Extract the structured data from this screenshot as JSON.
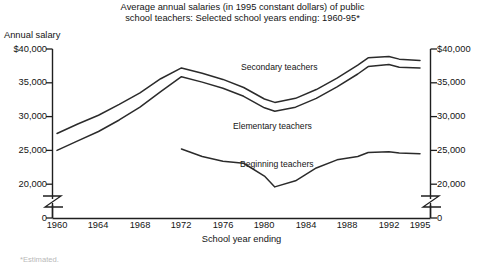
{
  "title": {
    "line1": "Average annual salaries (in 1995 constant dollars) of public",
    "line2": "school teachers: Selected school years ending: 1960-95*"
  },
  "axes": {
    "y_caption": "Annual salary",
    "x_title": "School year ending",
    "y_ticks": [
      "$40,000",
      "35,000",
      "30,000",
      "25,000",
      "20,000",
      "0"
    ],
    "x_ticks": [
      "1960",
      "1964",
      "1968",
      "1972",
      "1976",
      "1980",
      "1984",
      "1988",
      "1992",
      "1995"
    ],
    "axis_break": "zigzag-break"
  },
  "series_labels": {
    "secondary": "Secondary teachers",
    "elementary": "Elementary teachers",
    "beginning": "Beginning teachers"
  },
  "footnote": "*Estimated.",
  "colors": {
    "background": "#ffffff",
    "line": "#2b2b2b",
    "axis": "#1f1f1f",
    "text": "#141414"
  },
  "chart_data": {
    "type": "line",
    "title": "Average annual salaries (in 1995 constant dollars) of public school teachers: Selected school years ending: 1960-95*",
    "xlabel": "School year ending",
    "ylabel": "Annual salary",
    "ylim": [
      20000,
      40000
    ],
    "y_axis_broken_to_zero": true,
    "xlim": [
      1960,
      1995
    ],
    "grid": false,
    "legend": "inline-labels",
    "x_tick_values": [
      1960,
      1964,
      1968,
      1972,
      1976,
      1980,
      1984,
      1988,
      1992,
      1995
    ],
    "y_tick_values": [
      20000,
      25000,
      30000,
      35000,
      40000
    ],
    "series": [
      {
        "name": "Secondary teachers",
        "x": [
          1960,
          1962,
          1964,
          1966,
          1968,
          1970,
          1972,
          1974,
          1976,
          1978,
          1980,
          1981,
          1983,
          1985,
          1987,
          1989,
          1990,
          1992,
          1993,
          1995
        ],
        "values": [
          27500,
          28900,
          30200,
          31800,
          33500,
          35600,
          37200,
          36400,
          35500,
          34300,
          32600,
          32100,
          32700,
          34000,
          35700,
          37600,
          38700,
          38900,
          38500,
          38300
        ]
      },
      {
        "name": "Elementary teachers",
        "x": [
          1960,
          1962,
          1964,
          1966,
          1968,
          1970,
          1972,
          1974,
          1976,
          1978,
          1980,
          1981,
          1983,
          1985,
          1987,
          1989,
          1990,
          1992,
          1993,
          1995
        ],
        "values": [
          25000,
          26400,
          27800,
          29500,
          31400,
          33700,
          35900,
          35100,
          34200,
          33000,
          31300,
          30800,
          31400,
          32700,
          34400,
          36300,
          37400,
          37700,
          37300,
          37200
        ]
      },
      {
        "name": "Beginning teachers",
        "x": [
          1972,
          1974,
          1976,
          1978,
          1980,
          1981,
          1983,
          1985,
          1987,
          1989,
          1990,
          1992,
          1993,
          1995
        ],
        "values": [
          25200,
          24100,
          23400,
          23100,
          21200,
          19600,
          20500,
          22400,
          23600,
          24100,
          24700,
          24800,
          24600,
          24500
        ]
      }
    ]
  }
}
